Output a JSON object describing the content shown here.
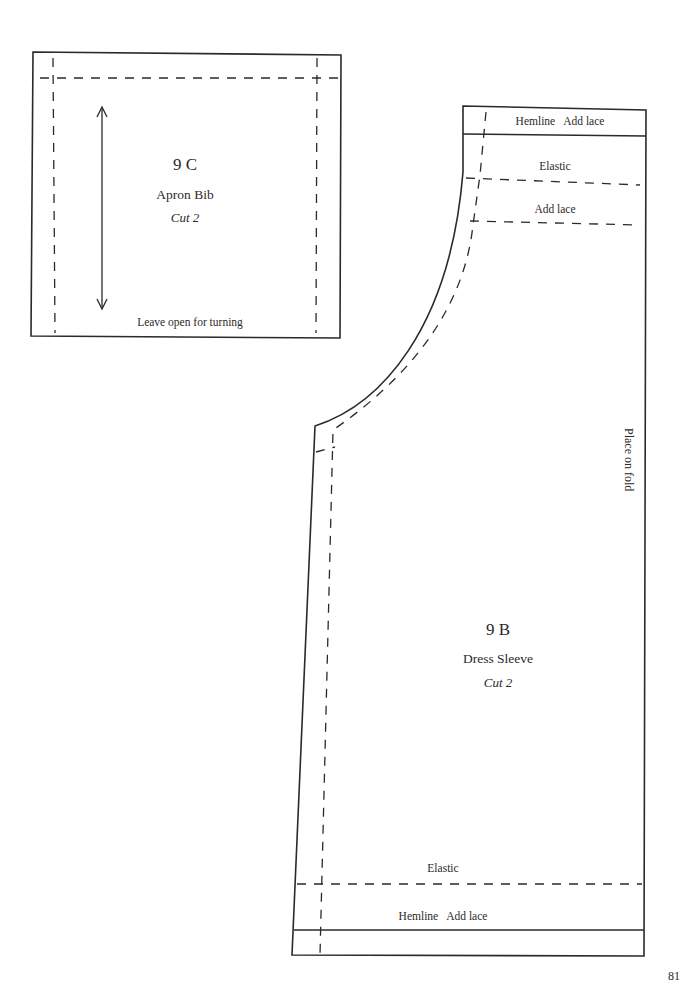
{
  "page": {
    "number": "81"
  },
  "pieces": {
    "apron_bib": {
      "id": "9 C",
      "name": "Apron Bib",
      "cut": "Cut 2",
      "note": "Leave open for turning",
      "grainline": "double-arrow"
    },
    "dress_sleeve": {
      "id": "9 B",
      "name": "Dress Sleeve",
      "cut": "Cut 2",
      "fold_label": "Place on fold",
      "top": {
        "hem_label": "Hemline   Add lace",
        "elastic_label": "Elastic",
        "lace_label": "Add lace"
      },
      "bottom": {
        "elastic_label": "Elastic",
        "hem_label": "Hemline   Add lace"
      }
    }
  },
  "colors": {
    "ink": "#2a2a2a",
    "paper": "#ffffff"
  }
}
